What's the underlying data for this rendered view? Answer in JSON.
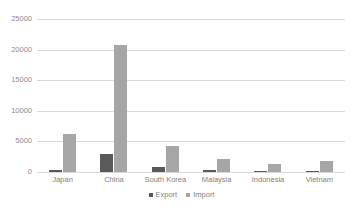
{
  "chart_data": {
    "type": "bar",
    "title": "",
    "subtitle": "",
    "xlabel": "",
    "ylabel": "",
    "categories": [
      "Japan",
      "China",
      "South Korea",
      "Malaysia",
      "Indonesia",
      "Vietnam"
    ],
    "series": [
      {
        "name": "Export",
        "color": "#595959",
        "values": [
          400,
          2900,
          800,
          250,
          150,
          200
        ]
      },
      {
        "name": "Import",
        "color": "#a6a6a6",
        "values": [
          6200,
          20700,
          4200,
          2100,
          1250,
          1750
        ]
      }
    ],
    "ylim": [
      0,
      25000
    ],
    "ytick_labels": [
      "0",
      "5000",
      "10000",
      "15000",
      "20000",
      "25000"
    ],
    "ytick_values": [
      0,
      5000,
      10000,
      15000,
      20000,
      25000
    ],
    "grid": "horizontal",
    "legend_position": "bottom",
    "gridline_color": "#d9d9d9",
    "text_color": "#7f7f7f",
    "background_color": "#ffffff"
  }
}
